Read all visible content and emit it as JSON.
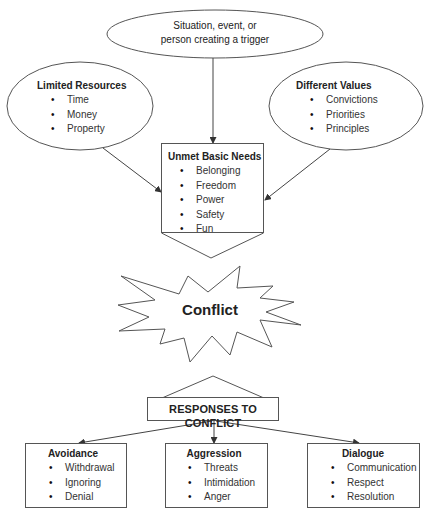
{
  "diagram": {
    "trigger": {
      "line1": "Situation, event, or",
      "line2": "person creating a trigger"
    },
    "limited_resources": {
      "title": "Limited Resources",
      "items": [
        "Time",
        "Money",
        "Property"
      ]
    },
    "different_values": {
      "title": "Different Values",
      "items": [
        "Convictions",
        "Priorities",
        "Principles"
      ]
    },
    "unmet_needs": {
      "title": "Unmet Basic Needs",
      "items": [
        "Belonging",
        "Freedom",
        "Power",
        "Safety",
        "Fun"
      ]
    },
    "conflict": {
      "label": "Conflict"
    },
    "responses": {
      "label": "RESPONSES TO CONFLICT"
    },
    "avoidance": {
      "title": "Avoidance",
      "items": [
        "Withdrawal",
        "Ignoring",
        "Denial"
      ]
    },
    "aggression": {
      "title": "Aggression",
      "items": [
        "Threats",
        "Intimidation",
        "Anger"
      ]
    },
    "dialogue": {
      "title": "Dialogue",
      "items": [
        "Communication",
        "Respect",
        "Resolution"
      ]
    },
    "colors": {
      "stroke": "#444444",
      "background": "#ffffff",
      "text": "#222222"
    }
  }
}
